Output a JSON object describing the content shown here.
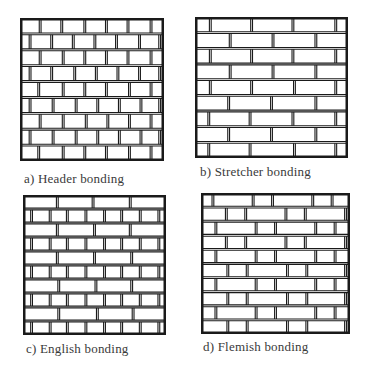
{
  "figure": {
    "panels": [
      {
        "id": "a",
        "caption": "a)  Header bonding",
        "box": {
          "x": 20,
          "y": 18,
          "w": 144,
          "h": 143
        },
        "caption_pos": {
          "x": 24,
          "y": 171
        },
        "rows": 9,
        "courses": [
          [
            0.14,
            0.29,
            0.45,
            0.6,
            0.75,
            0.91
          ],
          [
            0.07,
            0.22,
            0.37,
            0.52,
            0.67,
            0.83,
            0.97
          ],
          [
            0.14,
            0.3,
            0.45,
            0.6,
            0.75,
            0.91
          ],
          [
            0.07,
            0.22,
            0.38,
            0.53,
            0.68,
            0.83,
            0.97
          ],
          [
            0.13,
            0.3,
            0.45,
            0.6,
            0.76,
            0.91
          ],
          [
            0.07,
            0.23,
            0.39,
            0.54,
            0.69,
            0.84,
            0.97
          ],
          [
            0.14,
            0.3,
            0.46,
            0.61,
            0.76,
            0.91
          ],
          [
            0.07,
            0.23,
            0.39,
            0.54,
            0.69,
            0.84,
            0.97
          ],
          [
            0.13,
            0.3,
            0.45,
            0.6,
            0.76,
            0.91
          ]
        ]
      },
      {
        "id": "b",
        "caption": "b)  Stretcher bonding",
        "box": {
          "x": 195,
          "y": 17,
          "w": 153,
          "h": 141
        },
        "caption_pos": {
          "x": 200,
          "y": 164
        },
        "rows": 9,
        "courses": [
          [
            0.1,
            0.37,
            0.64,
            0.92
          ],
          [
            0.23,
            0.51,
            0.79
          ],
          [
            0.1,
            0.37,
            0.64,
            0.92
          ],
          [
            0.23,
            0.51,
            0.79
          ],
          [
            0.1,
            0.37,
            0.65,
            0.92
          ],
          [
            0.22,
            0.5,
            0.79
          ],
          [
            0.09,
            0.36,
            0.64,
            0.92
          ],
          [
            0.22,
            0.5,
            0.79
          ],
          [
            0.09,
            0.36,
            0.65,
            0.92
          ]
        ]
      },
      {
        "id": "c",
        "caption": "c)  English bonding",
        "box": {
          "x": 23,
          "y": 195,
          "w": 143,
          "h": 140
        },
        "caption_pos": {
          "x": 26,
          "y": 341
        },
        "rows": 10,
        "courses": [
          [
            0.24,
            0.49,
            0.75
          ],
          [
            0.06,
            0.19,
            0.31,
            0.44,
            0.57,
            0.69,
            0.82,
            0.95
          ],
          [
            0.24,
            0.5,
            0.75
          ],
          [
            0.06,
            0.19,
            0.31,
            0.44,
            0.57,
            0.69,
            0.82,
            0.95
          ],
          [
            0.24,
            0.5,
            0.76
          ],
          [
            0.06,
            0.19,
            0.31,
            0.44,
            0.57,
            0.69,
            0.82,
            0.95
          ],
          [
            0.25,
            0.51,
            0.76
          ],
          [
            0.06,
            0.19,
            0.31,
            0.44,
            0.57,
            0.69,
            0.82,
            0.95
          ],
          [
            0.25,
            0.52,
            0.77
          ],
          [
            0.06,
            0.19,
            0.31,
            0.44,
            0.57,
            0.69,
            0.82,
            0.95
          ]
        ]
      },
      {
        "id": "d",
        "caption": "d)  Flemish bonding",
        "box": {
          "x": 201,
          "y": 193,
          "w": 149,
          "h": 141
        },
        "caption_pos": {
          "x": 203,
          "y": 339
        },
        "rows": 10,
        "courses": [
          [
            0.08,
            0.35,
            0.48,
            0.75,
            0.88
          ],
          [
            0.17,
            0.3,
            0.57,
            0.7,
            0.97
          ],
          [
            0.1,
            0.37,
            0.5,
            0.77,
            0.9
          ],
          [
            0.17,
            0.3,
            0.57,
            0.7,
            0.97
          ],
          [
            0.1,
            0.37,
            0.5,
            0.77,
            0.9
          ],
          [
            0.18,
            0.31,
            0.58,
            0.71,
            0.97
          ],
          [
            0.1,
            0.37,
            0.5,
            0.77,
            0.9
          ],
          [
            0.18,
            0.31,
            0.58,
            0.71,
            0.97
          ],
          [
            0.1,
            0.37,
            0.5,
            0.77,
            0.9
          ],
          [
            0.18,
            0.31,
            0.58,
            0.71,
            0.97
          ]
        ]
      }
    ],
    "colors": {
      "line": "#1a1a1a",
      "paper": "#ffffff",
      "caption": "#3a3a3a"
    }
  }
}
